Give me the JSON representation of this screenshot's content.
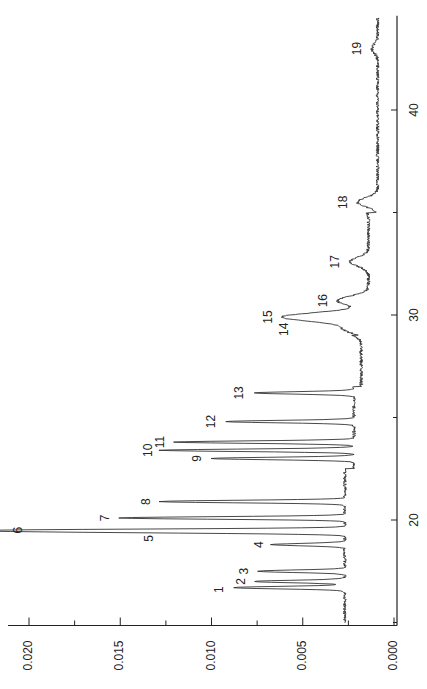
{
  "chart_data": {
    "type": "line",
    "orientation": "rotated-90-ccw",
    "title": "",
    "xlabel": "",
    "ylabel": "",
    "xlim": [
      15.0,
      44.5
    ],
    "ylim": [
      0.0,
      0.02
    ],
    "x_ticks": [
      20,
      30,
      40
    ],
    "x_tick_labels": [
      "20",
      "30",
      "40"
    ],
    "y_ticks": [
      0.0,
      0.005,
      0.01,
      0.015,
      0.02
    ],
    "y_tick_labels": [
      "0.000",
      "0.005",
      "0.010",
      "0.015",
      "0.020"
    ],
    "grid": false,
    "legend": null,
    "line_color": "#333333",
    "peaks": [
      {
        "label": "1",
        "time": 16.7,
        "absorbance": 0.0088
      },
      {
        "label": "2",
        "time": 17.0,
        "absorbance": 0.0077
      },
      {
        "label": "3",
        "time": 17.5,
        "absorbance": 0.0075
      },
      {
        "label": "4",
        "time": 18.8,
        "absorbance": 0.0067
      },
      {
        "label": "5",
        "time": 19.4,
        "absorbance": 0.0127
      },
      {
        "label": "6",
        "time": 19.5,
        "absorbance": 0.0198
      },
      {
        "label": "7",
        "time": 20.1,
        "absorbance": 0.015
      },
      {
        "label": "8",
        "time": 20.9,
        "absorbance": 0.0128
      },
      {
        "label": "9",
        "time": 23.0,
        "absorbance": 0.0101
      },
      {
        "label": "10",
        "time": 23.4,
        "absorbance": 0.0128
      },
      {
        "label": "11",
        "time": 23.8,
        "absorbance": 0.0121
      },
      {
        "label": "12",
        "time": 24.8,
        "absorbance": 0.0092
      },
      {
        "label": "13",
        "time": 26.2,
        "absorbance": 0.0077
      },
      {
        "label": "14",
        "time": 29.3,
        "absorbance": 0.0027
      },
      {
        "label": "15",
        "time": 29.9,
        "absorbance": 0.0061
      },
      {
        "label": "16",
        "time": 30.7,
        "absorbance": 0.0031
      },
      {
        "label": "17",
        "time": 32.6,
        "absorbance": 0.0024
      },
      {
        "label": "18",
        "time": 35.5,
        "absorbance": 0.002
      },
      {
        "label": "19",
        "time": 43.0,
        "absorbance": 0.0012
      }
    ],
    "baseline": [
      {
        "from": 15.0,
        "to": 22.5,
        "absorbance": 0.0027
      },
      {
        "from": 22.5,
        "to": 26.5,
        "absorbance": 0.0022
      },
      {
        "from": 26.5,
        "to": 29.0,
        "absorbance": 0.0018
      },
      {
        "from": 29.0,
        "to": 35.0,
        "absorbance": 0.0014
      },
      {
        "from": 35.0,
        "to": 44.5,
        "absorbance": 0.0009
      }
    ]
  }
}
